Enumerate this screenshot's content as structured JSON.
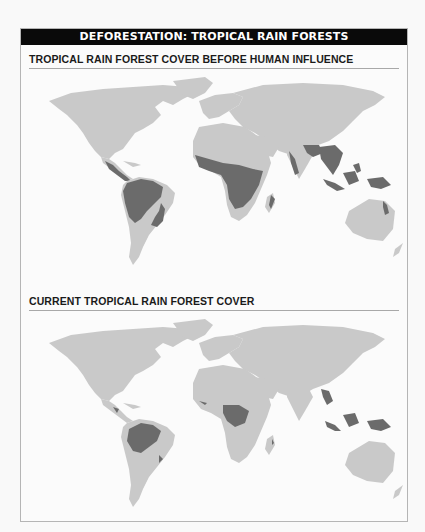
{
  "banner": {
    "title": "DEFORESTATION: TROPICAL RAIN FORESTS"
  },
  "sections": [
    {
      "title": "TROPICAL RAIN FOREST COVER BEFORE HUMAN INFLUENCE",
      "map_type": "world-map",
      "shaded_regions": [
        "Central America",
        "Amazon Basin",
        "Atlantic Forest (Brazil)",
        "Central & West Africa",
        "East Africa coast",
        "Madagascar (east)",
        "India (west coast & northeast)",
        "Sri Lanka",
        "Southeast Asia",
        "Indonesia",
        "Philippines",
        "New Guinea",
        "Northeast Australia"
      ]
    },
    {
      "title": "CURRENT TROPICAL RAIN FOREST COVER",
      "map_type": "world-map",
      "shaded_regions": [
        "Central America (fragments)",
        "Amazon Basin (reduced)",
        "Atlantic Forest (fragments)",
        "Congo Basin (reduced)",
        "West Africa coast (fragments)",
        "Madagascar (fragments)",
        "Myanmar/Thailand (fragments)",
        "Borneo",
        "Sumatra",
        "New Guinea",
        "Philippines (fragments)"
      ]
    }
  ],
  "legend_colors": {
    "land": "#c9c9c9",
    "rain_forest": "#6b6b6b",
    "banner_bg": "#0a0a0a",
    "banner_text": "#ffffff"
  }
}
